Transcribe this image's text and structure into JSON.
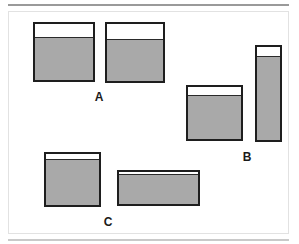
{
  "figure": {
    "canvas": {
      "width": 299,
      "height": 244
    },
    "background_color": "#ffffff",
    "frame": {
      "border_color": "#e2e2e2",
      "rule_top_color": "#9a9a9a",
      "rule_bottom_color": "#c9c9c9"
    }
  },
  "style": {
    "outline_color": "#1e1e1e",
    "fill_color": "#a9a9a9",
    "empty_color": "#ffffff",
    "label_color": "#1a1a1a"
  },
  "groups": [
    {
      "label": "A",
      "label_x": 99,
      "label_y": 91,
      "vessels": [
        {
          "name": "vessel-a-left",
          "x": 33,
          "y": 22,
          "width": 62,
          "height": 60,
          "fill_height": 43,
          "empty_height": 17,
          "fill_percent": 72
        },
        {
          "name": "vessel-a-right",
          "x": 105,
          "y": 22,
          "width": 60,
          "height": 61,
          "fill_height": 42,
          "empty_height": 19,
          "fill_percent": 69
        }
      ]
    },
    {
      "label": "B",
      "label_x": 247,
      "label_y": 151,
      "vessels": [
        {
          "name": "vessel-b-left",
          "x": 186,
          "y": 85,
          "width": 57,
          "height": 56,
          "fill_height": 44,
          "empty_height": 12,
          "fill_percent": 79
        },
        {
          "name": "vessel-b-right-tall",
          "x": 255,
          "y": 45,
          "width": 27,
          "height": 97,
          "fill_height": 84,
          "empty_height": 13,
          "fill_percent": 87
        }
      ]
    },
    {
      "label": "C",
      "label_x": 108,
      "label_y": 216,
      "vessels": [
        {
          "name": "vessel-c-left",
          "x": 44,
          "y": 152,
          "width": 57,
          "height": 55,
          "fill_height": 46,
          "empty_height": 9,
          "fill_percent": 84
        },
        {
          "name": "vessel-c-right-wide",
          "x": 117,
          "y": 170,
          "width": 83,
          "height": 36,
          "fill_height": 30,
          "empty_height": 6,
          "fill_percent": 83
        }
      ]
    }
  ]
}
